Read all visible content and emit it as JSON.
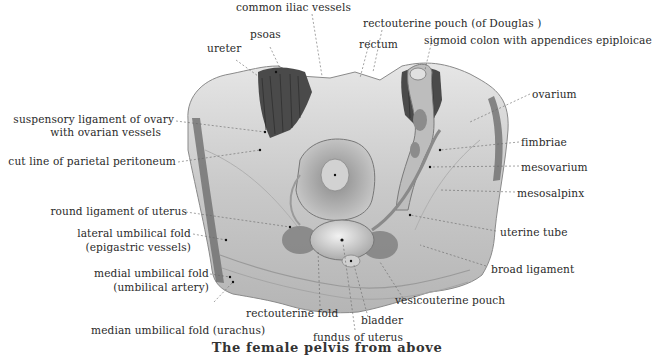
{
  "figure": {
    "caption": "The female pelvis from above",
    "labels_top": [
      {
        "id": "common-iliac-vessels",
        "text": "common iliac vessels"
      },
      {
        "id": "rectouterine-pouch",
        "text": "rectouterine pouch (of Douglas )"
      },
      {
        "id": "psoas",
        "text": "psoas"
      },
      {
        "id": "ureter",
        "text": "ureter"
      },
      {
        "id": "rectum",
        "text": "rectum"
      },
      {
        "id": "sigmoid-colon",
        "text": "sigmoid colon with appendices epiploicae"
      }
    ],
    "labels_left": [
      {
        "id": "suspensory-ligament",
        "text": "suspensory ligament of ovary",
        "text2": "with ovarian vessels"
      },
      {
        "id": "cut-line",
        "text": "cut line of parietal peritoneum"
      },
      {
        "id": "round-ligament",
        "text": "round ligament of uterus"
      },
      {
        "id": "lateral-umbilical-fold",
        "text": "lateral umbilical fold",
        "text2": "(epigastric vessels)"
      },
      {
        "id": "medial-umbilical-fold",
        "text": "medial umbilical fold",
        "text2": "(umbilical artery)"
      },
      {
        "id": "median-umbilical-fold",
        "text": "median umbilical fold (urachus)"
      }
    ],
    "labels_right": [
      {
        "id": "ovarium",
        "text": "ovarium"
      },
      {
        "id": "fimbriae",
        "text": "fimbriae"
      },
      {
        "id": "mesovarium",
        "text": "mesovarium"
      },
      {
        "id": "mesosalpinx",
        "text": "mesosalpinx"
      },
      {
        "id": "uterine-tube",
        "text": "uterine tube"
      },
      {
        "id": "broad-ligament",
        "text": "broad ligament"
      }
    ],
    "labels_bottom": [
      {
        "id": "rectouterine-fold",
        "text": "rectouterine fold"
      },
      {
        "id": "vesicouterine-pouch",
        "text": "vesicouterine pouch"
      },
      {
        "id": "bladder",
        "text": "bladder"
      },
      {
        "id": "fundus-of-uterus",
        "text": "fundus of uterus"
      }
    ],
    "colors": {
      "background": "#ffffff",
      "text": "#2a2a2a",
      "muscle": "#4a4a4a",
      "tissue_light": "#d9d9d9",
      "tissue_mid": "#a8a8a8",
      "leader_line": "#666666"
    }
  }
}
